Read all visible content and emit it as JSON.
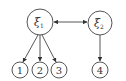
{
  "diagram": {
    "latent_nodes": [
      {
        "id": "xi1",
        "symbol": "ξ",
        "subscript": "1",
        "cx": 40,
        "cy": 22,
        "r": 13
      },
      {
        "id": "xi2",
        "symbol": "ξ",
        "subscript": "2",
        "cx": 100,
        "cy": 23,
        "r": 12
      }
    ],
    "observed_nodes": [
      {
        "id": "n1",
        "label": "1",
        "cx": 20,
        "cy": 70,
        "r": 8
      },
      {
        "id": "n2",
        "label": "2",
        "cx": 40,
        "cy": 70,
        "r": 8
      },
      {
        "id": "n3",
        "label": "3",
        "cx": 59,
        "cy": 70,
        "r": 8
      },
      {
        "id": "n4",
        "label": "4",
        "cx": 100,
        "cy": 70,
        "r": 8
      }
    ],
    "edges": [
      {
        "from": "xi1",
        "to": "xi2",
        "type": "bidirectional"
      },
      {
        "from": "xi1",
        "to": "n1",
        "type": "directed"
      },
      {
        "from": "xi1",
        "to": "n2",
        "type": "directed"
      },
      {
        "from": "xi1",
        "to": "n3",
        "type": "directed"
      },
      {
        "from": "xi2",
        "to": "n4",
        "type": "directed"
      }
    ]
  }
}
